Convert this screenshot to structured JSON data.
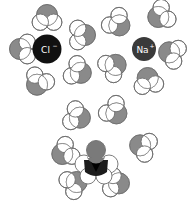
{
  "diagram": {
    "colors": {
      "oxygen": "#8a8a8a",
      "hydrogen": "#ffffff",
      "outline": "#6e6e6e",
      "chloride_ion": "#111111",
      "sodium_ion": "#3a3a3a",
      "central_water": "#1c1c1c",
      "central_water_oxygen": "#7a7a7a"
    },
    "clusters": [
      {
        "id": "chloride-cluster",
        "ion": {
          "symbol": "Cl",
          "charge": "−",
          "label": "Cl−"
        },
        "water_orientation": "hydrogens-toward-ion",
        "water_count": 5
      },
      {
        "id": "sodium-cluster",
        "ion": {
          "symbol": "Na",
          "charge": "+",
          "label": "Na+"
        },
        "water_orientation": "oxygen-toward-ion",
        "water_count": 5
      },
      {
        "id": "water-cluster",
        "ion": null,
        "central": "water molecule",
        "water_orientation": "hydrogen-bonded",
        "water_count": 6
      }
    ]
  }
}
